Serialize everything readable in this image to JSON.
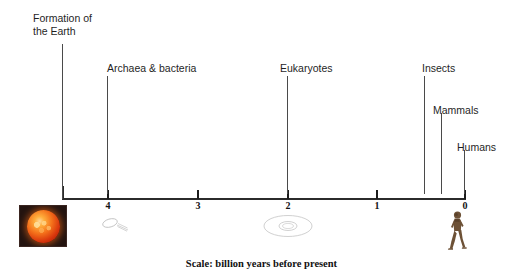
{
  "diagram": {
    "caption": "Scale: billion years before present",
    "background_color": "#ffffff",
    "axis_color": "#2b2b2b",
    "label_color": "#1f1f1f"
  },
  "axis": {
    "orientation": "horizontal",
    "unit": "billion years before present",
    "direction": "right is present",
    "min": 0,
    "max": 4.6,
    "ticks": [
      {
        "value": "4",
        "x": 107
      },
      {
        "value": "3",
        "x": 197
      },
      {
        "value": "2",
        "x": 287
      },
      {
        "value": "1",
        "x": 376
      },
      {
        "value": "0",
        "x": 464
      }
    ]
  },
  "events": [
    {
      "label_line1": "Formation of",
      "label_line2": "the Earth",
      "x": 62,
      "stem_top": 44,
      "label_left": 33,
      "label_top": 12
    },
    {
      "label_line1": "Archaea & bacteria",
      "label_line2": "",
      "x": 107,
      "stem_top": 76,
      "label_left": 107,
      "label_top": 62
    },
    {
      "label_line1": "Eukaryotes",
      "label_line2": "",
      "x": 287,
      "stem_top": 76,
      "label_left": 280,
      "label_top": 62
    },
    {
      "label_line1": "Insects",
      "label_line2": "",
      "x": 424,
      "stem_top": 76,
      "label_left": 422,
      "label_top": 62
    },
    {
      "label_line1": "Mammals",
      "label_line2": "",
      "x": 441,
      "stem_top": 113,
      "label_left": 433,
      "label_top": 104
    },
    {
      "label_line1": "Humans",
      "label_line2": "",
      "x": 464,
      "stem_top": 150,
      "label_left": 457,
      "label_top": 141
    }
  ],
  "illustrations": [
    {
      "name": "sun-image",
      "description": "red sun photograph"
    },
    {
      "name": "microbe-sketch",
      "description": "bacterium sketch"
    },
    {
      "name": "eukaryote-sketch",
      "description": "eukaryotic cell sketch"
    },
    {
      "name": "human-figure",
      "description": "walking hominid figure"
    }
  ]
}
